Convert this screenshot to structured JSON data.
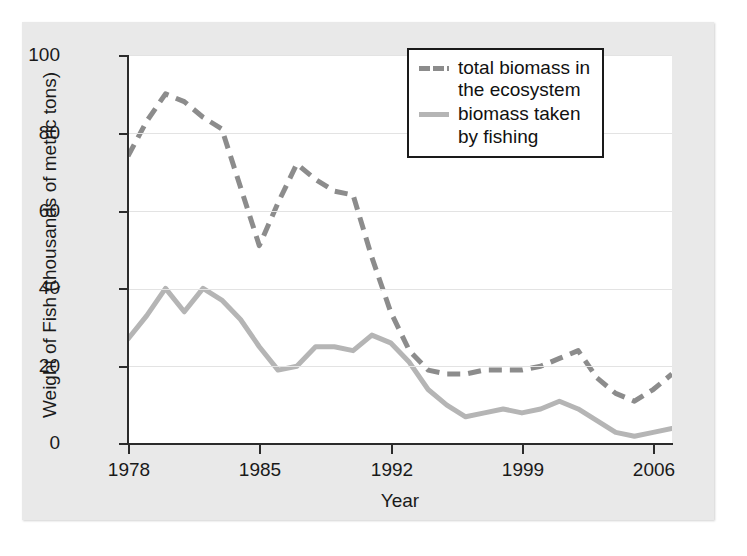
{
  "chart_data": {
    "type": "line",
    "title": "",
    "xlabel": "Year",
    "ylabel": "Weight of Fish (thousands of metric tons)",
    "xlim": [
      1978,
      2007
    ],
    "ylim": [
      0,
      100
    ],
    "xticks": [
      "1978",
      "1985",
      "1992",
      "1999",
      "2006"
    ],
    "xtick_values": [
      1978,
      1985,
      1992,
      1999,
      2006
    ],
    "yticks": [
      "0",
      "20",
      "40",
      "60",
      "80",
      "100"
    ],
    "ytick_values": [
      0,
      20,
      40,
      60,
      80,
      100
    ],
    "grid": true,
    "legend_position": "top-right",
    "x": [
      1978,
      1979,
      1980,
      1981,
      1982,
      1983,
      1984,
      1985,
      1986,
      1987,
      1988,
      1989,
      1990,
      1991,
      1992,
      1993,
      1994,
      1995,
      1996,
      1997,
      1998,
      1999,
      2000,
      2001,
      2002,
      2003,
      2004,
      2005,
      2006,
      2007
    ],
    "series": [
      {
        "name": "total biomass in the ecosystem",
        "style": "dashed",
        "color": "#8c8c8c",
        "values": [
          74,
          83,
          90,
          88,
          84,
          81,
          66,
          51,
          62,
          72,
          68,
          65,
          64,
          48,
          34,
          24,
          19,
          18,
          18,
          19,
          19,
          19,
          20,
          22,
          24,
          17,
          13,
          11,
          14,
          18
        ]
      },
      {
        "name": "biomass taken by fishing",
        "style": "solid",
        "color": "#b5b5b5",
        "values": [
          27,
          33,
          40,
          34,
          40,
          37,
          32,
          25,
          19,
          20,
          25,
          25,
          24,
          28,
          26,
          21,
          14,
          10,
          7,
          8,
          9,
          8,
          9,
          11,
          9,
          6,
          3,
          2,
          3,
          4
        ]
      }
    ]
  },
  "legend": {
    "items": [
      {
        "label": "total biomass in\nthe ecosystem",
        "style": "dashed"
      },
      {
        "label": "biomass taken\nby fishing",
        "style": "solid"
      }
    ]
  },
  "axes": {
    "x_title": "Year",
    "y_title": "Weight of Fish (thousands of metric tons)"
  },
  "colors": {
    "dashed_series": "#8c8c8c",
    "solid_series": "#b5b5b5",
    "axis": "#2b2b2b",
    "grid": "#e3e3e3",
    "panel_background": "#e9e9e9",
    "plot_background": "#ffffff"
  }
}
